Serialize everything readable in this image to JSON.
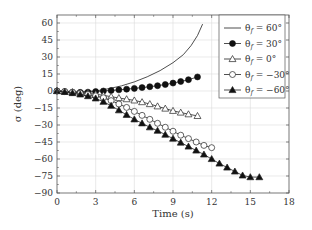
{
  "chart_data": {
    "type": "scatter",
    "title": "",
    "xlabel": "Time (s)",
    "ylabel": "σ (deg)",
    "xlim": [
      0,
      18
    ],
    "ylim": [
      -90,
      65
    ],
    "xticks": [
      0,
      3,
      6,
      9,
      12,
      15,
      18
    ],
    "yticks": [
      60,
      45,
      30,
      15,
      0,
      -15,
      -30,
      -45,
      -60,
      -75,
      -90
    ],
    "xtick_labels": [
      "0",
      "3",
      "6",
      "9",
      "12",
      "15",
      "18"
    ],
    "ytick_labels": [
      "60",
      "45",
      "30",
      "15",
      "0",
      "−15",
      "−30",
      "−45",
      "−60",
      "−75",
      "−90"
    ],
    "grid": true,
    "legend_position": "top-right",
    "series": [
      {
        "name": "θf = 60°",
        "legend_label": "θ",
        "legend_sub": "f",
        "legend_value": " = 60°",
        "marker": "none",
        "line": true,
        "x": [
          0,
          1.5,
          3,
          4,
          5,
          6,
          7,
          8,
          9,
          9.8,
          10.4,
          10.9,
          11.3
        ],
        "y": [
          0,
          -0.5,
          0,
          2,
          4.5,
          8,
          12.5,
          18,
          25,
          32,
          40,
          49,
          59
        ]
      },
      {
        "name": "θf = 30°",
        "legend_label": "θ",
        "legend_sub": "f",
        "legend_value": " = 30°",
        "marker": "filled-circle",
        "line": true,
        "x": [
          0,
          0.6,
          1.2,
          1.8,
          2.4,
          3.0,
          3.6,
          4.2,
          4.8,
          5.4,
          6.0,
          6.6,
          7.2,
          7.8,
          8.4,
          9.0,
          9.6,
          10.2,
          10.9
        ],
        "y": [
          0,
          -0.5,
          -1,
          -1.2,
          -1,
          -0.5,
          0,
          0.5,
          1,
          1.6,
          2.3,
          3.0,
          3.8,
          4.7,
          5.7,
          7,
          8.4,
          10,
          12.4
        ]
      },
      {
        "name": "θf = 0°",
        "legend_label": "θ",
        "legend_sub": "f",
        "legend_value": " = 0°",
        "marker": "open-triangle",
        "line": true,
        "x": [
          0,
          0.6,
          1.2,
          1.8,
          2.4,
          3.0,
          3.6,
          4.2,
          4.8,
          5.4,
          6.0,
          6.6,
          7.2,
          7.8,
          8.4,
          9.0,
          9.6,
          10.2,
          10.9
        ],
        "y": [
          0,
          -0.5,
          -1,
          -1.5,
          -2,
          -2.8,
          -3.8,
          -5,
          -6.2,
          -7.2,
          -8.3,
          -9.8,
          -11.5,
          -13.5,
          -15.5,
          -17.5,
          -19,
          -20.5,
          -22
        ]
      },
      {
        "name": "θf = −30°",
        "legend_label": "θ",
        "legend_sub": "f",
        "legend_value": " = −30°",
        "marker": "open-circle",
        "line": true,
        "x": [
          0,
          0.6,
          1.2,
          1.8,
          2.4,
          3.0,
          3.6,
          4.2,
          4.8,
          5.4,
          6.0,
          6.6,
          7.2,
          7.8,
          8.4,
          9.0,
          9.6,
          10.2,
          10.8,
          11.4,
          12.0
        ],
        "y": [
          0,
          -0.5,
          -1.2,
          -2,
          -3,
          -4.3,
          -6,
          -8.5,
          -11.5,
          -14.5,
          -18,
          -21.5,
          -25,
          -28.5,
          -32,
          -35.5,
          -39,
          -42,
          -45,
          -48,
          -50
        ]
      },
      {
        "name": "θf = −60°",
        "legend_label": "θ",
        "legend_sub": "f",
        "legend_value": " = −60°",
        "marker": "filled-triangle",
        "line": true,
        "x": [
          0,
          0.6,
          1.2,
          1.8,
          2.4,
          3.0,
          3.6,
          4.2,
          4.8,
          5.4,
          6.0,
          6.6,
          7.2,
          7.8,
          8.4,
          9.0,
          9.6,
          10.2,
          10.8,
          11.4,
          12.0,
          12.6,
          13.2,
          13.8,
          14.4,
          15.0,
          15.7
        ],
        "y": [
          0,
          -0.8,
          -1.8,
          -3,
          -4.5,
          -6.5,
          -9.5,
          -13,
          -17,
          -21,
          -25,
          -28.5,
          -32,
          -35,
          -38.5,
          -42,
          -45.5,
          -49,
          -52.5,
          -56,
          -60,
          -64,
          -67.5,
          -71,
          -74.5,
          -76,
          -76
        ]
      }
    ]
  }
}
